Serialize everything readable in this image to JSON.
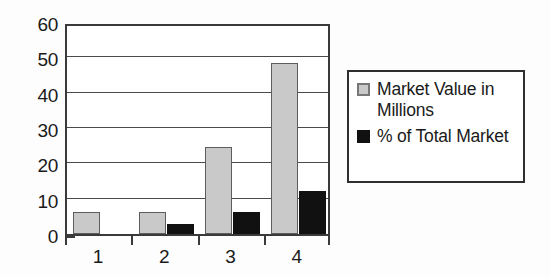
{
  "chart_data": {
    "type": "bar",
    "title": "",
    "subtitle": "",
    "xlabel": "",
    "ylabel": "",
    "categories": [
      "1",
      "2",
      "3",
      "4"
    ],
    "series": [
      {
        "name": "Market Value in Millions",
        "color": "#c9c9c9",
        "values": [
          6.2,
          6.2,
          24.5,
          48.3
        ]
      },
      {
        "name": "% of Total Market",
        "color": "#111111",
        "values": [
          0,
          2.7,
          6.3,
          12.3
        ]
      }
    ],
    "ylim": [
      0,
      60
    ],
    "y_ticks": [
      0,
      10,
      20,
      30,
      40,
      50,
      60
    ],
    "y_tick_labels": [
      "0",
      "10",
      "20",
      "30",
      "40",
      "50",
      "60"
    ],
    "grid": true,
    "grid_axis": "y",
    "legend_position": "right",
    "annotations": []
  },
  "legend": {
    "entries": [
      {
        "label": "Market Value in Millions",
        "swatch": "legend-swatch-gray"
      },
      {
        "label": "% of Total Market",
        "swatch": "legend-swatch-black"
      }
    ]
  }
}
